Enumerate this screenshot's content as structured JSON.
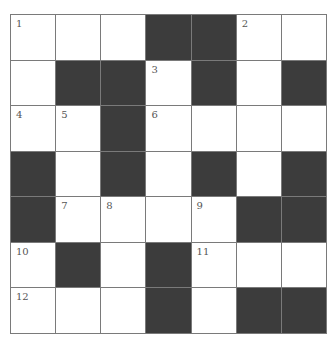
{
  "puzzle": {
    "rows": 7,
    "cols": 7,
    "colors": {
      "black": "#3c3c3c",
      "white": "#ffffff",
      "line": "#7a7a7a"
    },
    "grid": [
      [
        "W",
        "W",
        "W",
        "B",
        "B",
        "W",
        "W"
      ],
      [
        "W",
        "B",
        "B",
        "W",
        "B",
        "W",
        "B"
      ],
      [
        "W",
        "W",
        "B",
        "W",
        "W",
        "W",
        "W"
      ],
      [
        "B",
        "W",
        "B",
        "W",
        "B",
        "W",
        "B"
      ],
      [
        "B",
        "W",
        "W",
        "W",
        "W",
        "B",
        "B"
      ],
      [
        "W",
        "B",
        "W",
        "B",
        "W",
        "W",
        "W"
      ],
      [
        "W",
        "W",
        "W",
        "B",
        "W",
        "B",
        "B"
      ]
    ],
    "numbers": [
      [
        "1",
        "",
        "",
        "",
        "",
        "2",
        ""
      ],
      [
        "",
        "",
        "",
        "3",
        "",
        "",
        ""
      ],
      [
        "4",
        "5",
        "",
        "6",
        "",
        "",
        ""
      ],
      [
        "",
        "",
        "",
        "",
        "",
        "",
        ""
      ],
      [
        "",
        "7",
        "8",
        "",
        "9",
        "",
        ""
      ],
      [
        "10",
        "",
        "",
        "",
        "11",
        "",
        ""
      ],
      [
        "12",
        "",
        "",
        "",
        "",
        "",
        ""
      ]
    ]
  }
}
